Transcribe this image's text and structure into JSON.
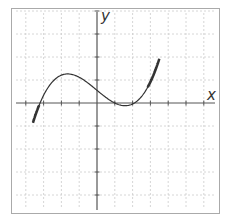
{
  "chart_data": {
    "type": "line",
    "title": "",
    "xlabel": "x",
    "ylabel": "y",
    "grid": true,
    "legend": null,
    "xlim": [
      -4,
      6
    ],
    "ylim": [
      -4.7,
      4.2
    ],
    "x_ticks": [
      -4,
      -3,
      -2,
      -1,
      0,
      1,
      2,
      3,
      4,
      5,
      6
    ],
    "y_ticks": [
      -4,
      -3,
      -2,
      -1,
      0,
      1,
      2,
      3,
      4
    ],
    "tick_labels_shown": false,
    "series": [
      {
        "name": "cubic f(x)",
        "description": "Cubic polynomial with local max near x=-1.5 and local min near x=1.7, x-intercepts near -3.2, 1.0, 2.1",
        "formula": "y = a*(x - r1)*(x - r2)*(x - r3)",
        "coefficients": {
          "a": 0.082,
          "r1": -3.2,
          "r2": 1.0,
          "r3": 2.1
        },
        "x": [
          -3.45,
          -3.2,
          -3.0,
          -2.5,
          -2.0,
          -1.5,
          -1.0,
          -0.5,
          0.0,
          0.5,
          1.0,
          1.5,
          1.7,
          2.1,
          2.5,
          3.0,
          3.3
        ],
        "y": [
          -4.5,
          0.0,
          0.5,
          1.0,
          1.2,
          1.2,
          1.05,
          0.7,
          0.55,
          0.3,
          0.0,
          -0.25,
          -0.3,
          0.0,
          0.8,
          2.6,
          4.2
        ],
        "color": "#333333",
        "emphasized_ends": true
      }
    ],
    "key_points": {
      "local_max": {
        "x": -1.5,
        "y": 1.2
      },
      "local_min": {
        "x": 1.7,
        "y": -0.3
      },
      "x_intercepts": [
        -3.2,
        1.0,
        2.1
      ],
      "y_intercept": 0.55
    }
  },
  "colors": {
    "border": "#aaaaaa",
    "grid": "#cccccc",
    "axis": "#555555",
    "curve": "#333333"
  },
  "labels": {
    "x_axis": "x",
    "y_axis": "y"
  }
}
